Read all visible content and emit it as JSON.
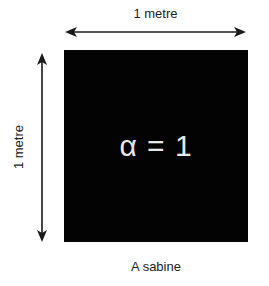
{
  "diagram": {
    "width_label": "1 metre",
    "height_label": "1 metre",
    "square_text": "α = 1",
    "caption": "A sabine",
    "colors": {
      "square_fill": "#030303",
      "square_text": "#e8e8e8",
      "arrow": "#1a1a1a",
      "background": "#ffffff"
    }
  }
}
